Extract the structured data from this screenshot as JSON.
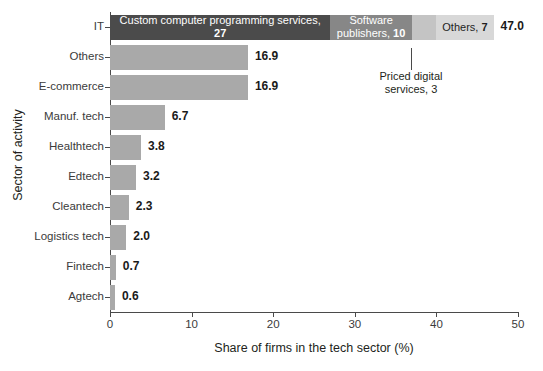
{
  "chart_data": {
    "type": "bar",
    "orientation": "horizontal",
    "title": "",
    "xlabel": "Share of firms in the tech sector (%)",
    "ylabel": "Sector of activity",
    "xlim": [
      0,
      50
    ],
    "xticks": [
      0,
      10,
      20,
      30,
      40,
      50
    ],
    "xtick_labels": [
      "0",
      "10",
      "20",
      "30",
      "40",
      "50"
    ],
    "grid": false,
    "legend": "none",
    "categories": [
      "IT",
      "Others",
      "E-commerce",
      "Manuf. tech",
      "Healthtech",
      "Edtech",
      "Cleantech",
      "Logistics tech",
      "Fintech",
      "Agtech"
    ],
    "values": [
      47.0,
      16.9,
      16.9,
      6.7,
      3.8,
      3.2,
      2.3,
      2.0,
      0.7,
      0.6
    ],
    "value_labels": [
      "47.0",
      "16.9",
      "16.9",
      "6.7",
      "3.8",
      "3.2",
      "2.3",
      "2.0",
      "0.7",
      "0.6"
    ],
    "stacked_row": {
      "category": "IT",
      "total": 47.0,
      "segments": [
        {
          "name": "Custom computer programming services",
          "value": 27,
          "label_text": "Custom computer programming services, ",
          "label_value": "27",
          "color": "#4b4b4b",
          "text_color": "light"
        },
        {
          "name": "Software publishers",
          "value": 10,
          "label_text": "Software publishers, ",
          "label_value": "10",
          "color": "#878787",
          "text_color": "light"
        },
        {
          "name": "Priced digital services",
          "value": 3,
          "label_text": "",
          "label_value": "",
          "color": "#c4c4c4",
          "text_color": "dark"
        },
        {
          "name": "Others",
          "value": 7,
          "label_text": "Others, ",
          "label_value": "7",
          "color": "#d8d8d8",
          "text_color": "dark"
        }
      ]
    },
    "annotations": [
      {
        "name": "priced-digital-services-callout",
        "line1": "Priced digital",
        "line2": "services, 3"
      }
    ],
    "colors": {
      "bar": "#a9a9a9",
      "segment_dark": "#4b4b4b",
      "segment_mid": "#878787",
      "segment_light": "#c4c4c4",
      "segment_lighter": "#d8d8d8",
      "axis": "#4a4a4a",
      "text": "#231f20",
      "background": "#ffffff"
    }
  }
}
